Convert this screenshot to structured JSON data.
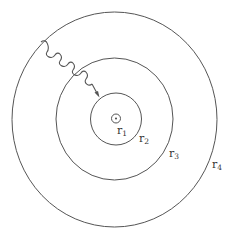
{
  "diagram": {
    "stroke_color": "#555555",
    "labels": {
      "r1": {
        "base": "r",
        "sub": "1"
      },
      "r2": {
        "base": "r",
        "sub": "2"
      },
      "r3": {
        "base": "r",
        "sub": "3"
      },
      "r4": {
        "base": "r",
        "sub": "4"
      }
    }
  }
}
